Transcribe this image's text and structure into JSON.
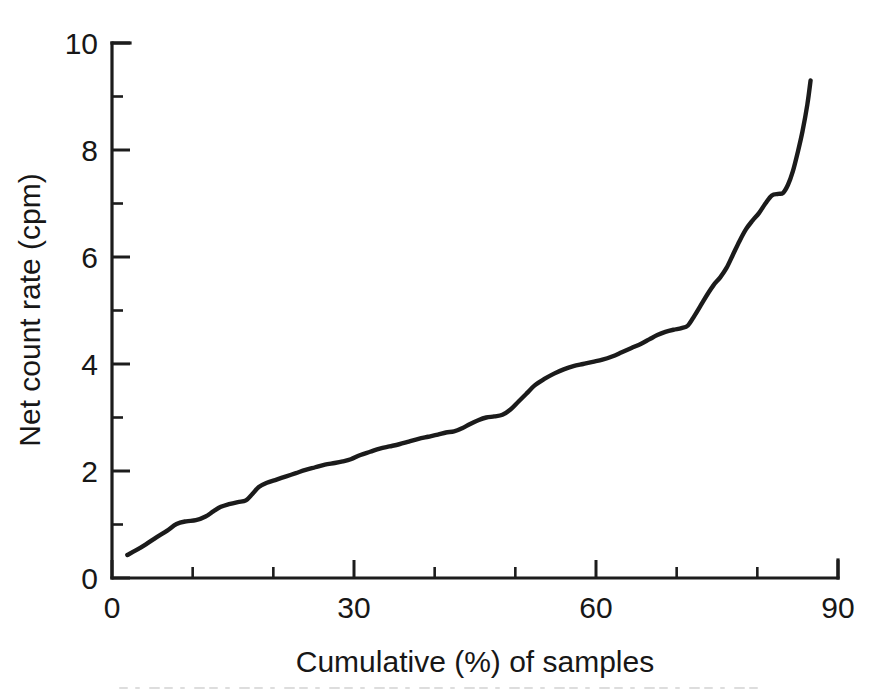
{
  "figure": {
    "background_color": "#ffffff",
    "line_color": "#1b1b1b",
    "axis_color": "#1c1c1c"
  },
  "chart_data": {
    "type": "line",
    "title": "",
    "subtitle": "",
    "xlabel": "Cumulative (%) of samples",
    "ylabel": "Net count rate (cpm)",
    "xlim": [
      0,
      90
    ],
    "ylim": [
      0,
      10
    ],
    "grid": false,
    "legend": null,
    "legend_position": "none",
    "x_ticks_major": [
      0,
      30,
      60,
      90
    ],
    "x_ticks_major_labels": [
      "0",
      "30",
      "60",
      "90"
    ],
    "x_ticks_minor": [
      10,
      20,
      40,
      50,
      70,
      80
    ],
    "y_ticks_major": [
      0,
      2,
      4,
      6,
      8,
      10
    ],
    "y_ticks_major_labels": [
      "0",
      "2",
      "4",
      "6",
      "8",
      "10"
    ],
    "y_ticks_minor": [
      1,
      3,
      5,
      7,
      9
    ],
    "series": [
      {
        "name": "Net count rate",
        "x": [
          1.9,
          3.0,
          4.2,
          5.5,
          6.8,
          8.0,
          9.2,
          10.4,
          11.6,
          12.6,
          13.5,
          14.5,
          15.6,
          16.6,
          17.4,
          18.2,
          19.2,
          20.4,
          21.6,
          22.8,
          24.0,
          25.2,
          26.4,
          27.6,
          28.6,
          29.6,
          30.8,
          32.0,
          33.2,
          34.4,
          35.6,
          36.8,
          38.0,
          39.2,
          40.4,
          41.4,
          42.4,
          43.4,
          44.4,
          45.4,
          46.4,
          47.4,
          48.4,
          49.4,
          50.4,
          51.4,
          52.4,
          53.6,
          54.8,
          56.0,
          57.2,
          58.4,
          59.6,
          60.8,
          62.0,
          63.2,
          64.4,
          65.6,
          66.6,
          67.6,
          68.6,
          69.6,
          70.6,
          71.4,
          72.2,
          73.0,
          73.8,
          74.6,
          75.4,
          76.2,
          77.0,
          77.8,
          78.6,
          79.4,
          80.2,
          81.0,
          81.8,
          82.6,
          83.2,
          83.8,
          84.4,
          85.0,
          85.6,
          86.2,
          86.6
        ],
        "y": [
          0.43,
          0.52,
          0.63,
          0.76,
          0.88,
          1.01,
          1.06,
          1.08,
          1.15,
          1.25,
          1.33,
          1.38,
          1.42,
          1.45,
          1.57,
          1.7,
          1.78,
          1.84,
          1.9,
          1.96,
          2.02,
          2.07,
          2.12,
          2.15,
          2.18,
          2.22,
          2.3,
          2.36,
          2.42,
          2.46,
          2.5,
          2.55,
          2.6,
          2.64,
          2.68,
          2.72,
          2.74,
          2.8,
          2.88,
          2.95,
          3.0,
          3.02,
          3.05,
          3.15,
          3.3,
          3.45,
          3.6,
          3.72,
          3.82,
          3.9,
          3.96,
          4.0,
          4.04,
          4.08,
          4.14,
          4.22,
          4.3,
          4.38,
          4.46,
          4.54,
          4.6,
          4.64,
          4.67,
          4.72,
          4.9,
          5.1,
          5.3,
          5.48,
          5.62,
          5.8,
          6.05,
          6.3,
          6.52,
          6.68,
          6.82,
          7.0,
          7.15,
          7.18,
          7.2,
          7.35,
          7.6,
          7.95,
          8.35,
          8.85,
          9.3
        ]
      }
    ]
  },
  "axis_titles": {
    "x": "Cumulative (%) of samples",
    "y": "Net count rate (cpm)"
  }
}
